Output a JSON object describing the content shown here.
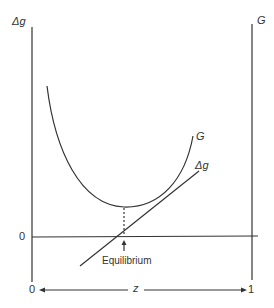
{
  "diagram": {
    "labels": {
      "left_axis": "Δg",
      "right_axis": "G",
      "zero_y": "0",
      "curve_G": "G",
      "line_dg": "Δg",
      "equilibrium": "Equilibrium",
      "x_start": "0",
      "x_mid": "z",
      "x_end": "1"
    },
    "colors": {
      "line": "#333333",
      "background": "#ffffff"
    },
    "elements": {
      "curve_G": "U-shaped convex curve with minimum above equilibrium point",
      "line_dg": "straight line with positive slope crossing zero at equilibrium",
      "dotted_drop": "vertical dotted line from G minimum to zero axis",
      "arrow": "up arrow marking equilibrium on zero axis"
    }
  }
}
